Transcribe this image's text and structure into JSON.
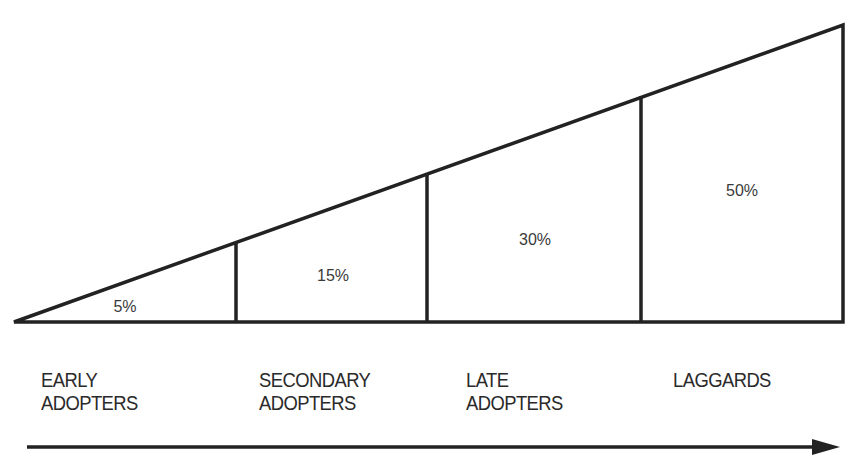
{
  "diagram": {
    "type": "adoption-wedge",
    "segments": [
      {
        "name": "early-adopters",
        "percent_label": "5%",
        "label_lines": [
          "EARLY",
          "ADOPTERS"
        ]
      },
      {
        "name": "secondary-adopters",
        "percent_label": "15%",
        "label_lines": [
          "SECONDARY",
          "ADOPTERS"
        ]
      },
      {
        "name": "late-adopters",
        "percent_label": "30%",
        "label_lines": [
          "LATE",
          "ADOPTERS"
        ]
      },
      {
        "name": "laggards",
        "percent_label": "50%",
        "label_lines": [
          "LAGGARDS"
        ]
      }
    ],
    "arrow_direction": "right",
    "line_color": "#222222",
    "text_color": "#3a3a3a"
  }
}
